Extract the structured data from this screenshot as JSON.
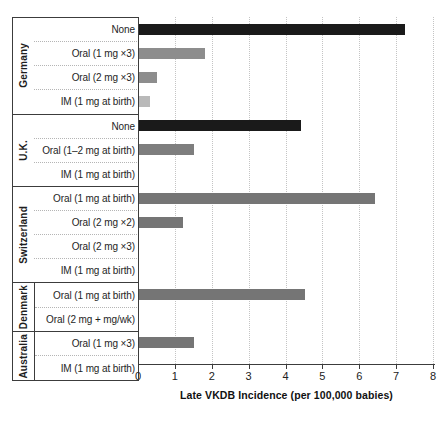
{
  "chart_data": {
    "type": "bar",
    "orientation": "horizontal",
    "xlabel": "Late VKDB Incidence (per 100,000 babies)",
    "xlim": [
      0,
      8
    ],
    "xticks": [
      0,
      1,
      2,
      3,
      4,
      5,
      6,
      7,
      8
    ],
    "grid": "vertical-dotted",
    "legend": "none",
    "colors": {
      "none_bar": "#1a1a1a",
      "oral_bar_light": "#8d8d8d",
      "oral_bar_dark": "#757575",
      "im_bar": "#b9b9b9",
      "axis_line": "#3c3c3c",
      "dotted_line": "#b5b5b5"
    },
    "groups": [
      {
        "name": "Germany",
        "label_divider": false,
        "rows": [
          {
            "label": "None",
            "value": 7.2,
            "color": "#1a1a1a"
          },
          {
            "label": "Oral (1 mg ×3)",
            "value": 1.8,
            "color": "#8d8d8d"
          },
          {
            "label": "Oral (2 mg ×3)",
            "value": 0.5,
            "color": "#8d8d8d"
          },
          {
            "label": "IM (1 mg at birth)",
            "value": 0.3,
            "color": "#b9b9b9"
          }
        ]
      },
      {
        "name": "U.K.",
        "label_divider": false,
        "rows": [
          {
            "label": "None",
            "value": 4.4,
            "color": "#1a1a1a"
          },
          {
            "label": "Oral (1–2 mg at birth)",
            "value": 1.5,
            "color": "#7e7e7e"
          },
          {
            "label": "IM (1 mg at birth)",
            "value": 0,
            "color": "#7e7e7e"
          }
        ]
      },
      {
        "name": "Switzerland",
        "label_divider": false,
        "rows": [
          {
            "label": "Oral (1 mg at birth)",
            "value": 6.4,
            "color": "#757575"
          },
          {
            "label": "Oral (2 mg ×2)",
            "value": 1.2,
            "color": "#757575"
          },
          {
            "label": "Oral (2 mg ×3)",
            "value": 0,
            "color": "#757575"
          },
          {
            "label": "IM (1 mg at birth)",
            "value": 0,
            "color": "#757575"
          }
        ]
      },
      {
        "name": "Denmark",
        "label_divider": true,
        "rows": [
          {
            "label": "Oral (1 mg at birth)",
            "value": 4.5,
            "color": "#757575"
          },
          {
            "label": "Oral (2 mg + mg/wk)",
            "value": 0,
            "color": "#757575"
          }
        ]
      },
      {
        "name": "Australia",
        "label_divider": true,
        "rows": [
          {
            "label": "Oral (1 mg ×3)",
            "value": 1.5,
            "color": "#757575"
          },
          {
            "label": "IM (1 mg at birth)",
            "value": 0,
            "color": "#757575"
          }
        ]
      }
    ]
  }
}
